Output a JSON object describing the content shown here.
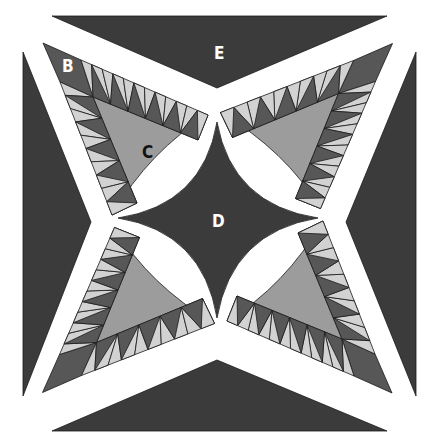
{
  "colors": {
    "background": "#ffffff",
    "dark": "#3b3b3b",
    "triangle_dark": "#575757",
    "triangle_light": "#d2d2d2",
    "fan_center": "#9c9c9c",
    "outline": "#1a1a1a",
    "label_light": "#ffffff",
    "label_dark": "#111111"
  },
  "labels": {
    "B": "B",
    "C": "C",
    "D": "D",
    "E": "E"
  },
  "pieces": [
    {
      "id": "B",
      "description": "corner square of fan unit"
    },
    {
      "id": "C",
      "description": "curved fan center"
    },
    {
      "id": "D",
      "description": "center four-point star"
    },
    {
      "id": "E",
      "description": "outer edge triangle"
    }
  ],
  "fan_units": 4,
  "sawtooth": {
    "top_strip_pairs": 6,
    "side_strip_pairs": 5
  }
}
